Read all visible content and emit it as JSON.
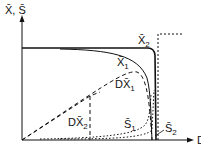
{
  "diagram": {
    "y_axis_label": "X̄, S̄",
    "x_axis_label": "D",
    "curves": [
      {
        "id": "X2",
        "label": "X̄",
        "subscript": "2",
        "style": "solid"
      },
      {
        "id": "X1",
        "label": "X̄",
        "subscript": "1",
        "style": "solid"
      },
      {
        "id": "DX1",
        "label": "DX̄",
        "subscript": "1",
        "style": "dashed"
      },
      {
        "id": "DX2",
        "label": "DX̄",
        "subscript": "2",
        "style": "dashed"
      },
      {
        "id": "S1",
        "label": "S̄",
        "subscript": "1",
        "style": "dotted"
      },
      {
        "id": "S2",
        "label": "S̄",
        "subscript": "2",
        "style": "dotted"
      }
    ],
    "colors": {
      "ink": "#111111",
      "background": "#ffffff"
    }
  }
}
